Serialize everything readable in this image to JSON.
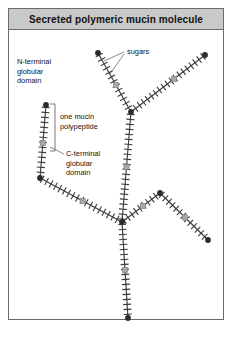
{
  "figure": {
    "title": "Secreted polymeric mucin molecule",
    "frame_border_color": "#6b6b6b",
    "title_bg_color": "#c9c9c9",
    "background_color": "#ffffff"
  },
  "labels": {
    "n_terminal": [
      "N-terminal",
      "globular",
      "domain"
    ],
    "one_mucin": [
      "one mucin",
      "polypeptide"
    ],
    "c_terminal": [
      "C-terminal",
      "globular",
      "domain"
    ],
    "sugars": "sugars"
  },
  "legend_colors": {
    "backbone": "#3a3a3a",
    "sugar_bristle": "#3a3a3a",
    "n_terminal_node": "#2b2b2b",
    "c_terminal_square": "#a8a8a8",
    "leader_line": "#555555"
  },
  "chart_data": {
    "type": "diagram",
    "title": "Secreted polymeric mucin molecule",
    "segments": [
      {
        "id": "upper-left-arm",
        "x1": 98,
        "y1": 53,
        "x2": 131,
        "y2": 112,
        "square_t": 0.54
      },
      {
        "id": "upper-right-arm",
        "x1": 205,
        "y1": 55,
        "x2": 131,
        "y2": 112,
        "square_t": 0.42
      },
      {
        "id": "central-trunk",
        "x1": 131,
        "y1": 112,
        "x2": 122,
        "y2": 222,
        "square_t": 0.5
      },
      {
        "id": "lower-left-arm",
        "x1": 40,
        "y1": 178,
        "x2": 122,
        "y2": 222,
        "square_t": 0.52
      },
      {
        "id": "mid-left-vertical",
        "x1": 46,
        "y1": 105,
        "x2": 40,
        "y2": 178,
        "square_t": 0.52
      },
      {
        "id": "lower-right-arm",
        "x1": 122,
        "y1": 222,
        "x2": 160,
        "y2": 193,
        "square_t": 0.55
      },
      {
        "id": "right-peak-down",
        "x1": 160,
        "y1": 193,
        "x2": 208,
        "y2": 240,
        "square_t": 0.52
      },
      {
        "id": "bottom-stem",
        "x1": 122,
        "y1": 222,
        "x2": 128,
        "y2": 318,
        "square_t": 0.5
      }
    ],
    "n_terminal_nodes": [
      {
        "x": 98,
        "y": 53
      },
      {
        "x": 205,
        "y": 55
      },
      {
        "x": 46,
        "y": 105
      },
      {
        "x": 131,
        "y": 112
      },
      {
        "x": 40,
        "y": 178
      },
      {
        "x": 160,
        "y": 193
      },
      {
        "x": 122,
        "y": 222
      },
      {
        "x": 208,
        "y": 240
      },
      {
        "x": 128,
        "y": 318
      }
    ],
    "label_positions": {
      "n_terminal": {
        "x": 17,
        "y": 64
      },
      "one_mucin": {
        "x": 60,
        "y": 119
      },
      "c_terminal": {
        "x": 66,
        "y": 156
      },
      "sugars": {
        "x": 127,
        "y": 54
      }
    },
    "bracket": {
      "x": 55,
      "y_top": 104,
      "y_bottom": 151,
      "tick": 5
    },
    "leaders": [
      {
        "x1": 124,
        "y1": 52,
        "x2": 104,
        "y2": 61
      },
      {
        "x1": 124,
        "y1": 54,
        "x2": 110,
        "y2": 74
      },
      {
        "x1": 64,
        "y1": 154,
        "x2": 50,
        "y2": 147
      }
    ],
    "line_width": 1.1,
    "bristle_spacing": 5.0,
    "bristle_length": 4.0
  }
}
